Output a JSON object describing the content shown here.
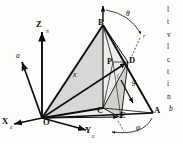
{
  "figure": {
    "type": "3d-geometry-diagram",
    "background_color": "#fdfdfc",
    "line_color": "#0d0d0d",
    "shade_color": "#c9c9c6",
    "shade_color_light": "#dedede"
  },
  "axes": {
    "z": {
      "label": "Z",
      "subscript": "N"
    },
    "x": {
      "label": "X",
      "subscript": "E"
    },
    "y": {
      "label": "Y",
      "subscript": "E"
    },
    "origin": {
      "label": "O"
    }
  },
  "points": [
    {
      "name": "apex",
      "label": "B",
      "x": 103,
      "y": 25
    },
    {
      "name": "vertex-a",
      "label": "A",
      "x": 153,
      "y": 113
    },
    {
      "name": "vertex-c",
      "label": "C",
      "x": 103,
      "y": 108
    },
    {
      "name": "vertex-d",
      "label": "D",
      "x": 128,
      "y": 62
    },
    {
      "name": "vertex-e",
      "label": "E",
      "x": 121,
      "y": 118
    },
    {
      "name": "point-p",
      "label": "P",
      "x": 113,
      "y": 62
    },
    {
      "name": "origin",
      "label": "O",
      "x": 42,
      "y": 118
    }
  ],
  "vectors": [
    {
      "name": "vector-a",
      "label": "a"
    },
    {
      "name": "vector-r",
      "label": "r"
    },
    {
      "name": "vector-x",
      "label": "x"
    },
    {
      "name": "vector-g",
      "label": "g"
    },
    {
      "name": "vector-b",
      "label": "b"
    },
    {
      "name": "vector-f",
      "label": "f"
    }
  ],
  "angles": [
    {
      "name": "angle-theta",
      "label": "θ"
    },
    {
      "name": "angle-phi",
      "label": "φ"
    }
  ],
  "body_text": {
    "lines": [
      "l",
      "t",
      "v",
      "l",
      "c",
      "t",
      "i",
      "n"
    ]
  }
}
